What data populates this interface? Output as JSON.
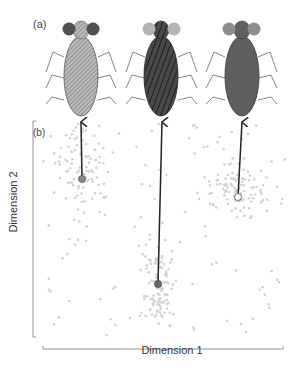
{
  "panels": {
    "a": {
      "label": "(a)"
    },
    "b": {
      "label": "(b)"
    }
  },
  "axes": {
    "x_label": "Dimension 1",
    "y_label": "Dimension 2"
  },
  "insects": [
    {
      "name": "insect-1",
      "body_pattern": "fine-diagonal-hatch",
      "body_color": "#a8a8a8",
      "eye_color": "#505050",
      "cluster_center": [
        83,
        178
      ],
      "point_style": "filled-gray"
    },
    {
      "name": "insect-2",
      "body_pattern": "bold-diagonal-stripes",
      "body_color": "#3c3c3c",
      "eye_color": "#b4b4b4",
      "cluster_center": [
        158,
        284
      ],
      "point_style": "filled-dark"
    },
    {
      "name": "insect-3",
      "body_pattern": "dense-crosshatch",
      "body_color": "#555555",
      "eye_color": "#8e8e8e",
      "cluster_center": [
        238,
        197
      ],
      "point_style": "hollow"
    }
  ],
  "colors": {
    "scatter_points": "#d2d2d2",
    "arrow": "#222222",
    "axis": "#888888"
  }
}
